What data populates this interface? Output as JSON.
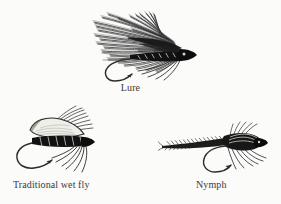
{
  "plate": {
    "background_color": "#fbfbfa",
    "ink_color": "#1a1a1a",
    "caption_color": "#3a3a38",
    "width": 281,
    "height": 204
  },
  "figures": [
    {
      "id": "lure",
      "icon": "fishing-lure-icon",
      "caption": "Lure",
      "description": "Streamer lure with long swept-back hackle wing, dark ribbed body and down-turned hook"
    },
    {
      "id": "traditional-wet-fly",
      "icon": "traditional-wet-fly-icon",
      "caption": "Traditional wet fly",
      "description": "Wet fly with pale slip wing, dark segmented body, soft hackle and curved hook"
    },
    {
      "id": "nymph",
      "icon": "nymph-fly-icon",
      "caption": "Nymph",
      "description": "Slim spiky nymph with long tapered abdomen, bristled thorax, legs and curved hook"
    }
  ]
}
